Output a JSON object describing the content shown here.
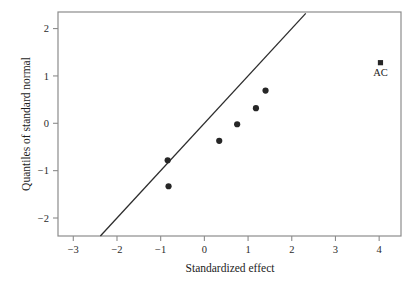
{
  "chart_data": {
    "type": "scatter",
    "title": "",
    "xlabel": "Standardized effect",
    "ylabel": "Quantiles of standard normal",
    "xlim": [
      -3.35,
      4.5
    ],
    "ylim": [
      -2.38,
      2.35
    ],
    "xticks": [
      "-3",
      "-2",
      "-1",
      "0",
      "1",
      "2",
      "3",
      "4"
    ],
    "xtick_values": [
      -3,
      -2,
      -1,
      0,
      1,
      2,
      3,
      4
    ],
    "yticks": [
      "2",
      "1",
      "0",
      "-1",
      "-2"
    ],
    "ytick_values": [
      2,
      1,
      0,
      -1,
      -2
    ],
    "grid": false,
    "legend": "none",
    "points": [
      {
        "x": -0.82,
        "y": -1.33,
        "marker": "circle",
        "label": ""
      },
      {
        "x": -0.84,
        "y": -0.78,
        "marker": "circle",
        "label": ""
      },
      {
        "x": 0.34,
        "y": -0.37,
        "marker": "circle",
        "label": ""
      },
      {
        "x": 0.75,
        "y": -0.02,
        "marker": "circle",
        "label": ""
      },
      {
        "x": 1.18,
        "y": 0.32,
        "marker": "circle",
        "label": ""
      },
      {
        "x": 1.4,
        "y": 0.69,
        "marker": "circle",
        "label": ""
      },
      {
        "x": 4.03,
        "y": 1.28,
        "marker": "square",
        "label": "AC"
      }
    ],
    "reference_line": {
      "name": "normal-reference-line",
      "x1": -2.38,
      "y1": -2.38,
      "x2": 2.32,
      "y2": 2.32
    },
    "colors": {
      "marker": "#262626",
      "line": "#2d2d2d",
      "frame": "#8c8c8c",
      "tick_text": "#2b2b2b",
      "background": "#ffffff"
    }
  }
}
